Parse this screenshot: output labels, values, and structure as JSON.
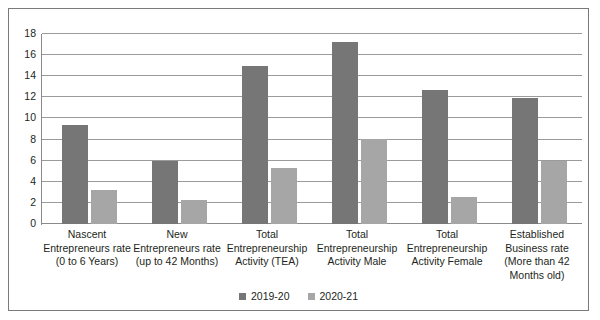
{
  "chart_data": {
    "type": "bar",
    "title": "",
    "xlabel": "",
    "ylabel": "",
    "ylim": [
      0,
      18
    ],
    "ytick_step": 2,
    "yticks": [
      "18",
      "16",
      "14",
      "12",
      "10",
      "8",
      "6",
      "4",
      "2",
      "0"
    ],
    "grid": true,
    "legend_position": "bottom",
    "colors": {
      "series_2019_20": "#767676",
      "series_2020_21": "#a6a6a6",
      "gridline": "#9b9b9b",
      "border": "#7a7a7a",
      "text": "#231f20"
    },
    "categories": [
      [
        "Nascent",
        "Entrepreneurs rate",
        "(0 to 6 Years)"
      ],
      [
        "New",
        "Entrepreneurs rate",
        "(up to 42 Months)"
      ],
      [
        "Total",
        "Entrepreneurship",
        "Activity (TEA)"
      ],
      [
        "Total",
        "Entrepreneurship",
        "Activity Male"
      ],
      [
        "Total",
        "Entrepreneurship",
        "Activity Female"
      ],
      [
        "Established",
        "Business rate",
        "(More than 42",
        "Months old)"
      ]
    ],
    "series": [
      {
        "name": "2019-20",
        "values": [
          9.4,
          6.0,
          15.0,
          17.2,
          12.7,
          11.9
        ]
      },
      {
        "name": "2020-21",
        "values": [
          3.2,
          2.25,
          5.3,
          8.1,
          2.6,
          6.0
        ]
      }
    ]
  }
}
